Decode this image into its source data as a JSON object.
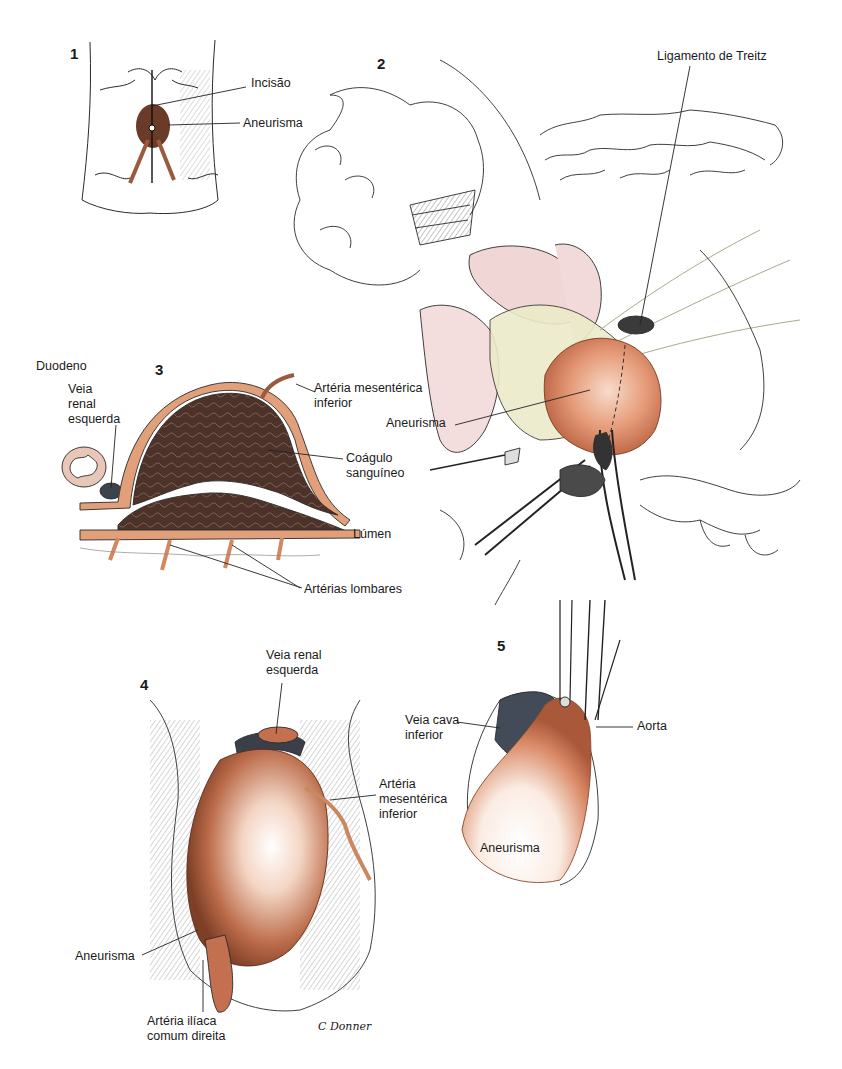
{
  "figure": {
    "panels": [
      {
        "id": 1,
        "number": "1",
        "x": 70,
        "y": 46
      },
      {
        "id": 2,
        "number": "2",
        "x": 377,
        "y": 56
      },
      {
        "id": 3,
        "number": "3",
        "x": 155,
        "y": 362
      },
      {
        "id": 4,
        "number": "4",
        "x": 140,
        "y": 677
      },
      {
        "id": 5,
        "number": "5",
        "x": 497,
        "y": 638
      }
    ],
    "labels": [
      {
        "panel": 1,
        "text": "Incisão",
        "x": 251,
        "y": 82
      },
      {
        "panel": 1,
        "text": "Aneurisma",
        "x": 243,
        "y": 117
      },
      {
        "panel": 2,
        "text": "Ligamento de Treitz",
        "x": 657,
        "y": 55
      },
      {
        "panel": 2,
        "text": "Aneurisma",
        "x": 386,
        "y": 416
      },
      {
        "panel": 3,
        "text": "Duodeno",
        "x": 36,
        "y": 359
      },
      {
        "panel": 3,
        "text": "Veia\nrenal\nesquerda",
        "x": 68,
        "y": 384
      },
      {
        "panel": 3,
        "text": "Artéria mesentérica\ninferior",
        "x": 314,
        "y": 382
      },
      {
        "panel": 3,
        "text": "Coágulo\nsanguíneo",
        "x": 346,
        "y": 450
      },
      {
        "panel": 3,
        "text": "Lúmen",
        "x": 353,
        "y": 527
      },
      {
        "panel": 3,
        "text": "Artérias lombares",
        "x": 304,
        "y": 583
      },
      {
        "panel": 4,
        "text": "Veia renal\nesquerda",
        "x": 266,
        "y": 650
      },
      {
        "panel": 4,
        "text": "Artéria\nmesentérica\ninferior",
        "x": 379,
        "y": 780
      },
      {
        "panel": 4,
        "text": "Aneurisma",
        "x": 75,
        "y": 953
      },
      {
        "panel": 4,
        "text": "Artéria ilíaca\ncomum direita",
        "x": 147,
        "y": 1016
      },
      {
        "panel": 5,
        "text": "Veia cava\ninferior",
        "x": 405,
        "y": 717
      },
      {
        "panel": 5,
        "text": "Aorta",
        "x": 637,
        "y": 719
      },
      {
        "panel": 5,
        "text": "Aneurisma",
        "x": 480,
        "y": 841
      }
    ],
    "signature": {
      "text": "C Donner",
      "x": 318,
      "y": 1025
    },
    "colors": {
      "line": "#2a2a2a",
      "aneurysm": "#d9805f",
      "aneurysm_dark": "#a8583a",
      "aneurysm_light": "#f6d7c6",
      "clot": "#4a3128",
      "vessel_wall": "#e2a07a",
      "vein": "#3a3f4a",
      "mesentery": "#e8e7c2",
      "bowel_pink": "#f1d6d6"
    }
  }
}
